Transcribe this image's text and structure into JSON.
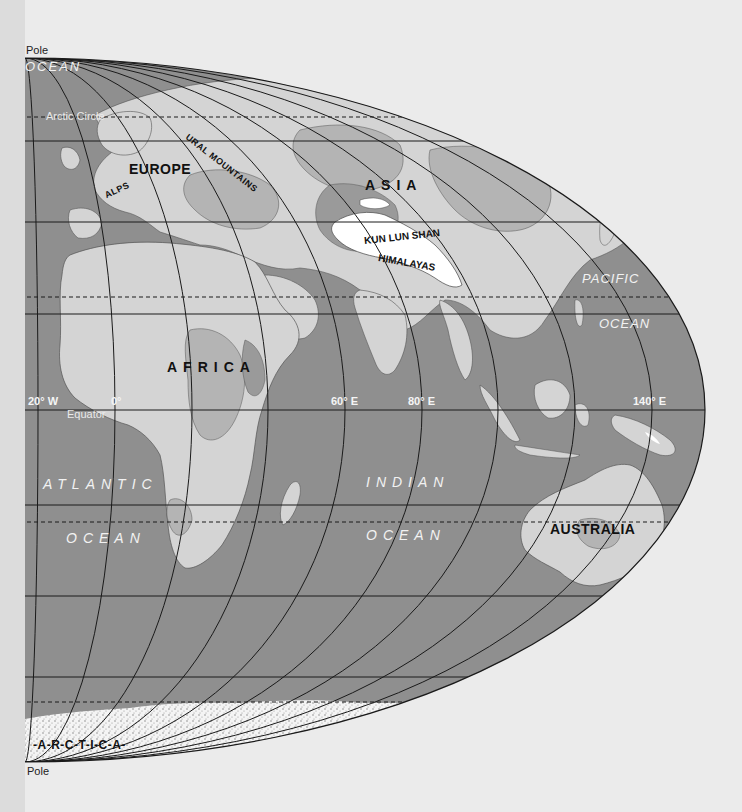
{
  "map": {
    "projection": "elliptical world map (half visible)",
    "colors": {
      "ocean": "#8f8f8f",
      "land_low": "#d4d4d4",
      "land_mid": "#b4b4b4",
      "land_high": "#9a9a9a",
      "peaks": "#ffffff",
      "background": "#ebebeb",
      "grid": "#1a1a1a"
    },
    "poles": {
      "north": "Pole",
      "south": "Pole"
    },
    "parallels": {
      "arctic_circle": "Arctic Circle",
      "equator": "Equator"
    },
    "meridian_labels": [
      "20° W",
      "0°",
      "60° E",
      "80° E",
      "140° E"
    ],
    "oceans": {
      "arctic_fragment": "OCEAN",
      "atlantic_1": "ATLANTIC",
      "atlantic_2": "OCEAN",
      "indian_1": "INDIAN",
      "indian_2": "OCEAN",
      "pacific_1": "PACIFIC",
      "pacific_2": "OCEAN"
    },
    "continents": {
      "europe": "EUROPE",
      "asia": "ASIA",
      "africa": "AFRICA",
      "australia": "AUSTRALIA",
      "antarctica_fragment": "-A-R-C-T-I-C-A-"
    },
    "mountains": {
      "alps": "ALPS",
      "urals": "URAL MOUNTAINS",
      "kunlun": "KUN LUN SHAN",
      "himalayas": "HIMALAYAS"
    }
  }
}
